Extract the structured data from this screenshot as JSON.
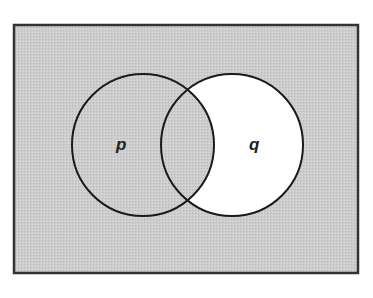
{
  "diagram": {
    "type": "venn",
    "sets": [
      {
        "label": "p"
      },
      {
        "label": "q"
      }
    ],
    "shaded_regions": [
      "outside both circles",
      "p only",
      "p and q (intersection)"
    ],
    "unshaded_regions": [
      "q only"
    ],
    "colors": {
      "shade": "#c9c9c9",
      "unshaded": "#ffffff",
      "outline": "#1a1a1a"
    }
  }
}
